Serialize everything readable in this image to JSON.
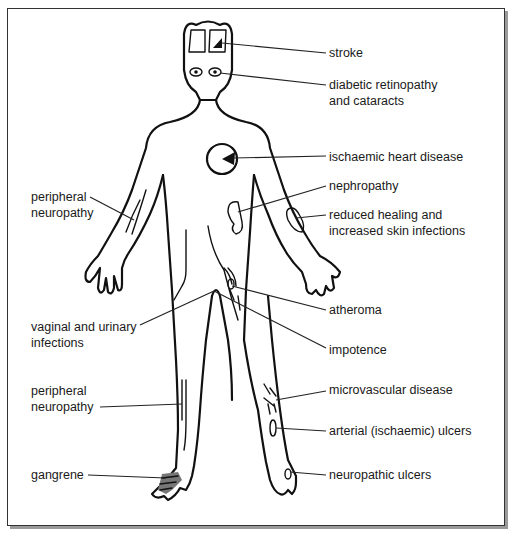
{
  "diagram": {
    "labels_right": [
      {
        "id": "stroke",
        "lines": [
          "stroke"
        ]
      },
      {
        "id": "retinopathy",
        "lines": [
          "diabetic retinopathy",
          "and cataracts"
        ]
      },
      {
        "id": "heart",
        "lines": [
          "ischaemic heart disease"
        ]
      },
      {
        "id": "nephropathy",
        "lines": [
          "nephropathy"
        ]
      },
      {
        "id": "healing",
        "lines": [
          "reduced healing and",
          "increased skin infections"
        ]
      },
      {
        "id": "atheroma",
        "lines": [
          "atheroma"
        ]
      },
      {
        "id": "impotence",
        "lines": [
          "impotence"
        ]
      },
      {
        "id": "microvascular",
        "lines": [
          "microvascular disease"
        ]
      },
      {
        "id": "arterial-ulcers",
        "lines": [
          "arterial (ischaemic) ulcers"
        ]
      },
      {
        "id": "neuropathic-ulcers",
        "lines": [
          "neuropathic ulcers"
        ]
      }
    ],
    "labels_left": [
      {
        "id": "peripheral-neuropathy-arm",
        "lines": [
          "peripheral",
          "neuropathy"
        ]
      },
      {
        "id": "vaginal-urinary",
        "lines": [
          "vaginal and urinary",
          "infections"
        ]
      },
      {
        "id": "peripheral-neuropathy-leg",
        "lines": [
          "peripheral",
          "neuropathy"
        ]
      },
      {
        "id": "gangrene",
        "lines": [
          "gangrene"
        ]
      }
    ],
    "icons": {
      "body": "human-body-outline-icon",
      "brain": "brain-icon",
      "eyes": "eye-icon",
      "heart": "heart-icon",
      "kidney": "kidney-icon",
      "skin-lesion": "skin-lesion-icon",
      "foot-gangrene": "gangrene-foot-icon"
    }
  }
}
